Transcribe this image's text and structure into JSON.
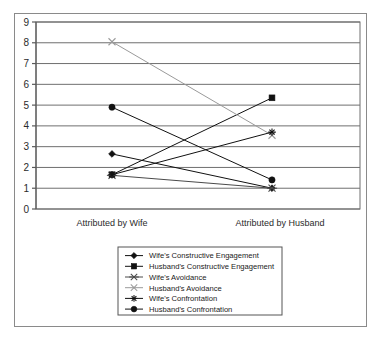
{
  "chart_data": {
    "type": "line",
    "title": "",
    "xlabel": "",
    "ylabel": "",
    "categories": [
      "Attributed by Wife",
      "Attributed by Husband"
    ],
    "ylim": [
      0,
      9
    ],
    "yticks": [
      0,
      1,
      2,
      3,
      4,
      5,
      6,
      7,
      8,
      9
    ],
    "grid": true,
    "legend_position": "bottom",
    "series": [
      {
        "name": "Wife's Constructive Engagement",
        "marker": "diamond",
        "color": "#111111",
        "values": [
          2.65,
          1.0
        ]
      },
      {
        "name": "Husband's Constructive Engagement",
        "marker": "square",
        "color": "#111111",
        "values": [
          1.65,
          5.35
        ]
      },
      {
        "name": "Wife's Avoidance",
        "marker": "x-dash",
        "color": "#4a4a4a",
        "values": [
          1.62,
          1.0
        ]
      },
      {
        "name": "Husband's Avoidance",
        "marker": "x-light",
        "color": "#9a9a9a",
        "values": [
          8.05,
          3.55
        ]
      },
      {
        "name": "Wife's Confrontation",
        "marker": "asterisk",
        "color": "#111111",
        "values": [
          1.65,
          3.7
        ]
      },
      {
        "name": "Husband's Confrontation",
        "marker": "circle",
        "color": "#111111",
        "values": [
          4.9,
          1.4
        ]
      }
    ]
  },
  "axis": {
    "y_ticks": [
      "0",
      "1",
      "2",
      "3",
      "4",
      "5",
      "6",
      "7",
      "8",
      "9"
    ],
    "x_left_label": "Attributed by Wife",
    "x_right_label": "Attributed by Husband"
  },
  "legend": {
    "items": [
      {
        "label": "Wife's Constructive Engagement"
      },
      {
        "label": "Husband's Constructive Engagement"
      },
      {
        "label": "Wife's Avoidance"
      },
      {
        "label": "Husband's Avoidance"
      },
      {
        "label": "Wife's Confrontation"
      },
      {
        "label": "Husband's Confrontation"
      }
    ]
  },
  "colors": {
    "grid": "#6f6f6f",
    "axis": "#5a5a5a",
    "border": "#8a8a8a",
    "dark_series": "#111111",
    "mid_series": "#4a4a4a",
    "light_series": "#9a9a9a"
  }
}
